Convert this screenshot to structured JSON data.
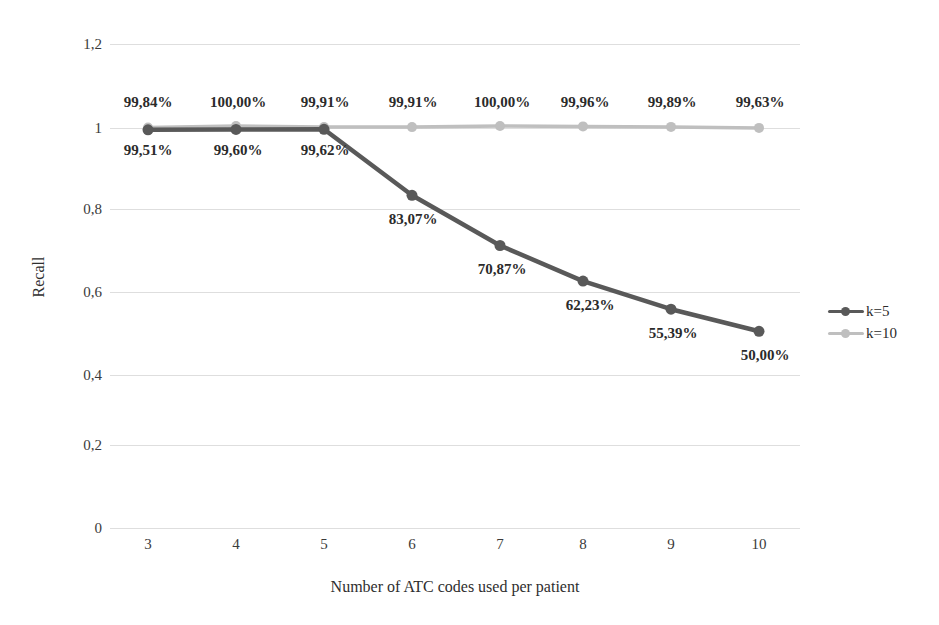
{
  "chart_data": {
    "type": "line",
    "title": "",
    "xlabel": "Number of ATC codes used per patient",
    "ylabel": "Recall",
    "categories": [
      "3",
      "4",
      "5",
      "6",
      "7",
      "8",
      "9",
      "10"
    ],
    "x": [
      3,
      4,
      5,
      6,
      7,
      8,
      9,
      10
    ],
    "xlim": [
      3,
      10
    ],
    "ylim": [
      0,
      1.2
    ],
    "y_ticks": [
      0,
      0.2,
      0.4,
      0.6,
      0.8,
      1,
      1.2
    ],
    "y_tick_labels": [
      "0",
      "0,2",
      "0,4",
      "0,6",
      "0,8",
      "1",
      "1,2"
    ],
    "x_tick_labels": [
      "3",
      "4",
      "5",
      "6",
      "7",
      "8",
      "9",
      "10"
    ],
    "grid": true,
    "grid_axis": "y",
    "legend_position": "right",
    "decimal_separator": ",",
    "series": [
      {
        "name": "k=5",
        "color": "#595959",
        "values": [
          0.9951,
          0.996,
          0.9962,
          0.8307,
          0.7087,
          0.6223,
          0.5539,
          0.5
        ],
        "labels": [
          "99,51%",
          "99,60%",
          "99,62%",
          "83,07%",
          "70,87%",
          "62,23%",
          "55,39%",
          "50,00%"
        ]
      },
      {
        "name": "k=10",
        "color": "#bfbfbf",
        "values": [
          0.9984,
          1.0,
          0.9991,
          0.9991,
          1.0,
          0.9996,
          0.9989,
          0.9963
        ],
        "labels": [
          "99,84%",
          "100,00%",
          "99,91%",
          "99,91%",
          "100,00%",
          "99,96%",
          "99,89%",
          "99,63%"
        ]
      }
    ]
  },
  "legend": {
    "items": [
      {
        "label": "k=5",
        "color": "#595959"
      },
      {
        "label": "k=10",
        "color": "#bfbfbf"
      }
    ]
  },
  "axes": {
    "x_title": "Number of ATC codes used per patient",
    "y_title": "Recall"
  },
  "colors": {
    "series_k5": "#595959",
    "series_k10": "#bfbfbf",
    "gridline": "#dedede",
    "text": "#2e2e2e",
    "background": "#ffffff"
  }
}
